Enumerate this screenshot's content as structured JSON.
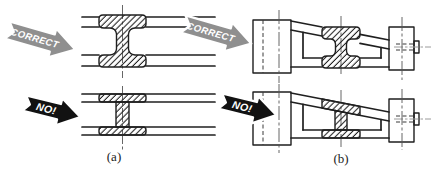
{
  "figure": {
    "colors": {
      "background": "#ffffff",
      "ink": "#1f1f1f",
      "correct_arrow": "#8f8f8f",
      "no_arrow": "#121212",
      "centerline": "#555555",
      "hidden_line": "#3a3a3a",
      "label_ink": "#222222"
    },
    "panels": [
      {
        "id": "a",
        "label": "(a)",
        "correct_tag": "CORRECT",
        "wrong_tag": "NO!"
      },
      {
        "id": "b",
        "label": "(b)",
        "correct_tag": "CORRECT",
        "wrong_tag": "NO!"
      }
    ]
  }
}
